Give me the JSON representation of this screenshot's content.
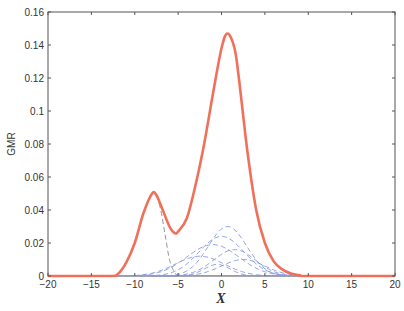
{
  "chart_data": {
    "type": "line",
    "title": "",
    "xlabel": "X",
    "ylabel": "GMR",
    "xlim": [
      -20,
      20
    ],
    "ylim": [
      0,
      0.16
    ],
    "grid": false,
    "legend": null,
    "xticks": [
      -20,
      -15,
      -10,
      -5,
      0,
      5,
      10,
      15,
      20
    ],
    "xtick_labels": [
      "-20",
      "-15",
      "-10",
      "-5",
      "0",
      "5",
      "10",
      "15",
      "20"
    ],
    "yticks": [
      0,
      0.02,
      0.04,
      0.06,
      0.08,
      0.1,
      0.12,
      0.14,
      0.16
    ],
    "ytick_labels": [
      "0",
      "0.02",
      "0.04",
      "0.06",
      "0.08",
      "0.1",
      "0.12",
      "0.14",
      "0.16"
    ],
    "series": [
      {
        "name": "GMR density (solid)",
        "color": "#f0705a",
        "style": "solid",
        "x": [
          -20,
          -13,
          -12,
          -11,
          -10,
          -9,
          -8,
          -7.5,
          -7,
          -6,
          -5.4,
          -5,
          -4,
          -3,
          -2,
          -1,
          0,
          0.7,
          1.5,
          2,
          3,
          4,
          5,
          6,
          7,
          8,
          9,
          10,
          20
        ],
        "y": [
          0,
          0,
          0.001,
          0.008,
          0.02,
          0.038,
          0.05,
          0.049,
          0.043,
          0.03,
          0.026,
          0.027,
          0.035,
          0.055,
          0.08,
          0.11,
          0.138,
          0.147,
          0.138,
          0.12,
          0.075,
          0.04,
          0.02,
          0.009,
          0.004,
          0.0015,
          0.0005,
          0,
          0
        ]
      },
      {
        "name": "Left component (dashed)",
        "color": "#888888",
        "style": "dashed",
        "x": [
          -12,
          -11,
          -10,
          -9,
          -8,
          -7.5,
          -7,
          -6.5,
          -6,
          -5.5,
          -5
        ],
        "y": [
          0.001,
          0.008,
          0.02,
          0.038,
          0.05,
          0.049,
          0.04,
          0.025,
          0.01,
          0.003,
          0
        ]
      },
      {
        "name": "Component A (dashed)",
        "color": "#8899dd",
        "style": "dashed",
        "peak_x": 0.7,
        "peak_y": 0.03,
        "sigma": 2.2
      },
      {
        "name": "Component B (dashed)",
        "color": "#8899dd",
        "style": "dashed",
        "peak_x": 0.0,
        "peak_y": 0.024,
        "sigma": 2.6
      },
      {
        "name": "Component C (dashed)",
        "color": "#8899dd",
        "style": "dashed",
        "peak_x": -1.0,
        "peak_y": 0.019,
        "sigma": 3.0
      },
      {
        "name": "Component D (dashed)",
        "color": "#8899dd",
        "style": "dashed",
        "peak_x": 1.5,
        "peak_y": 0.016,
        "sigma": 2.4
      },
      {
        "name": "Component E (dashed)",
        "color": "#8899dd",
        "style": "dashed",
        "peak_x": -2.5,
        "peak_y": 0.012,
        "sigma": 2.8
      },
      {
        "name": "Component F (dashed)",
        "color": "#8899dd",
        "style": "dashed",
        "peak_x": 2.5,
        "peak_y": 0.01,
        "sigma": 2.5
      },
      {
        "name": "Component G (dashed)",
        "color": "#8899dd",
        "style": "dashed",
        "peak_x": -0.5,
        "peak_y": 0.007,
        "sigma": 1.5
      }
    ]
  },
  "axes": {
    "xlabel": "X",
    "ylabel": "GMR"
  },
  "colors": {
    "main_curve": "#f0705a",
    "left_component": "#888888",
    "components": "#8899dd",
    "axis": "#555555"
  }
}
